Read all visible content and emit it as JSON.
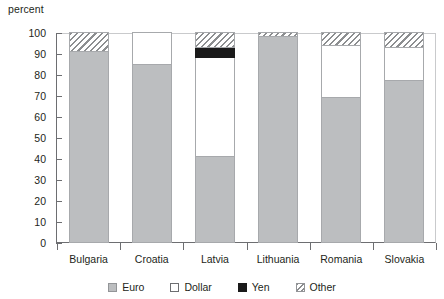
{
  "chart_data": {
    "type": "bar",
    "subtype": "stacked-bar-100",
    "title": "",
    "xlabel": "",
    "ylabel": "percent",
    "ylim": [
      0,
      100
    ],
    "yticks": [
      0,
      10,
      20,
      30,
      40,
      50,
      60,
      70,
      80,
      90,
      100
    ],
    "grid": false,
    "legend_position": "bottom",
    "categories": [
      "Bulgaria",
      "Croatia",
      "Latvia",
      "Lithuania",
      "Romania",
      "Slovakia"
    ],
    "series": [
      {
        "name": "Euro",
        "color": "#bcbec0",
        "pattern": "solid",
        "values": [
          91,
          85,
          41,
          98,
          69,
          77
        ]
      },
      {
        "name": "Dollar",
        "color": "#ffffff",
        "pattern": "solid",
        "values": [
          0,
          15,
          47,
          0,
          25,
          16
        ]
      },
      {
        "name": "Yen",
        "color": "#1a1a1a",
        "pattern": "solid",
        "values": [
          0,
          0,
          5,
          0,
          0,
          0
        ]
      },
      {
        "name": "Other",
        "color": "#8c8e90",
        "pattern": "hatched",
        "values": [
          9,
          0,
          7,
          2,
          6,
          7
        ]
      }
    ]
  },
  "axis": {
    "unit_label": "percent"
  },
  "legend": {
    "items": [
      {
        "label": "Euro",
        "swatch": "swatch-euro-solid-gray"
      },
      {
        "label": "Dollar",
        "swatch": "swatch-dollar-white"
      },
      {
        "label": "Yen",
        "swatch": "swatch-yen-black"
      },
      {
        "label": "Other",
        "swatch": "swatch-other-hatched"
      }
    ]
  }
}
